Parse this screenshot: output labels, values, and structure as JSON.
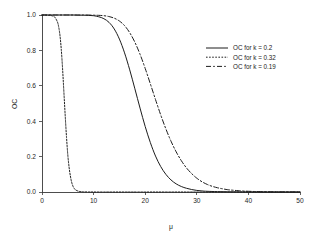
{
  "chart_data": {
    "type": "line",
    "title": "",
    "xlabel": "μ",
    "ylabel": "OC",
    "xlim": [
      0,
      50
    ],
    "ylim": [
      0.0,
      1.0
    ],
    "xticks": [
      0,
      10,
      20,
      30,
      40,
      50
    ],
    "xtick_labels": [
      "0",
      "10",
      "20",
      "30",
      "40",
      "50"
    ],
    "yticks": [
      0.0,
      0.2,
      0.4,
      0.6,
      0.8,
      1.0
    ],
    "ytick_labels": [
      "0.0",
      "0.2",
      "0.4",
      "0.6",
      "0.8",
      "1.0"
    ],
    "grid": false,
    "legend_position": "upper right",
    "series": [
      {
        "name": "OC for k = 0.2",
        "k": 0.2,
        "style": "solid",
        "color": "#1c1c1c",
        "x": [
          0,
          1,
          2,
          3,
          4,
          5,
          6,
          7,
          8,
          9,
          10,
          11,
          12,
          13,
          14,
          15,
          16,
          17,
          18,
          19,
          20,
          21,
          22,
          23,
          24,
          25,
          26,
          27,
          28,
          29,
          30,
          31,
          32,
          34,
          36,
          38,
          40,
          44,
          50
        ],
        "values": [
          1.0,
          1.0,
          1.0,
          1.0,
          1.0,
          1.0,
          1.0,
          0.999,
          0.999,
          0.998,
          0.996,
          0.99,
          0.979,
          0.958,
          0.921,
          0.864,
          0.786,
          0.69,
          0.583,
          0.474,
          0.37,
          0.279,
          0.203,
          0.144,
          0.1,
          0.068,
          0.046,
          0.031,
          0.021,
          0.014,
          0.009,
          0.006,
          0.004,
          0.002,
          0.001,
          0.0005,
          0.0002,
          0.0,
          0.0
        ]
      },
      {
        "name": "OC for k = 0.32",
        "k": 0.32,
        "style": "dotted",
        "color": "#1c1c1c",
        "x": [
          0,
          0.5,
          1,
          1.5,
          2,
          2.5,
          3,
          3.25,
          3.5,
          3.75,
          4,
          4.25,
          4.5,
          4.75,
          5,
          5.25,
          5.5,
          5.75,
          6,
          6.25,
          6.5,
          7,
          7.5,
          8,
          9,
          10,
          12,
          16,
          20,
          30,
          40,
          50
        ],
        "values": [
          1.0,
          1.0,
          0.999,
          0.998,
          0.995,
          0.987,
          0.96,
          0.93,
          0.88,
          0.8,
          0.69,
          0.56,
          0.43,
          0.31,
          0.21,
          0.14,
          0.09,
          0.055,
          0.033,
          0.02,
          0.012,
          0.005,
          0.002,
          0.001,
          0.0003,
          0.0001,
          0.0,
          0.0,
          0.0,
          0.0,
          0.0,
          0.0
        ]
      },
      {
        "name": "OC for k = 0.19",
        "k": 0.19,
        "style": "dashdot",
        "color": "#1c1c1c",
        "x": [
          0,
          2,
          4,
          6,
          8,
          10,
          11,
          12,
          13,
          14,
          15,
          16,
          17,
          18,
          19,
          20,
          21,
          22,
          23,
          24,
          25,
          26,
          27,
          28,
          29,
          30,
          31,
          32,
          33,
          34,
          35,
          36,
          37,
          38,
          39,
          40,
          42,
          44,
          46,
          48,
          50
        ],
        "values": [
          1.0,
          1.0,
          1.0,
          1.0,
          1.0,
          0.999,
          0.998,
          0.996,
          0.991,
          0.982,
          0.966,
          0.94,
          0.9,
          0.846,
          0.778,
          0.698,
          0.611,
          0.522,
          0.436,
          0.357,
          0.287,
          0.227,
          0.177,
          0.136,
          0.104,
          0.078,
          0.058,
          0.043,
          0.032,
          0.024,
          0.018,
          0.013,
          0.01,
          0.0075,
          0.0055,
          0.004,
          0.0022,
          0.0012,
          0.0006,
          0.0003,
          0.0001
        ]
      }
    ]
  },
  "legend": {
    "entries": [
      {
        "label": "OC for k = 0.2",
        "style": "solid"
      },
      {
        "label": "OC for k = 0.32",
        "style": "dotted"
      },
      {
        "label": "OC for k = 0.19",
        "style": "dashdot"
      }
    ]
  },
  "axes": {
    "x_title": "μ",
    "y_title": "OC"
  }
}
